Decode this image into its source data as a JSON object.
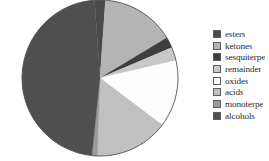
{
  "chart_data": {
    "type": "pie",
    "title": "",
    "subtitle": "",
    "xlabel": "",
    "ylabel": "",
    "grid": false,
    "legend_position": "right",
    "start_angle_deg": -94,
    "direction": "clockwise",
    "categories": [
      "esters",
      "ketones",
      "sesquiterpe",
      "remainder",
      "oxides",
      "acids",
      "monoterpe",
      "alcohols"
    ],
    "values": [
      2.2,
      15.3,
      2.2,
      2.8,
      13.9,
      15.3,
      1.1,
      47.2
    ],
    "angles_deg": [
      8,
      55,
      8,
      10,
      50,
      55,
      4,
      170
    ],
    "colors": [
      "#4a4a4a",
      "#b4b4b4",
      "#3e3e3e",
      "#c8c8c8",
      "#fdfdfd",
      "#c0c0c0",
      "#9a9a9a",
      "#4f4f4f"
    ],
    "slices": [
      {
        "label": "esters",
        "value": 2.2,
        "angle_deg": 8,
        "color": "#4a4a4a"
      },
      {
        "label": "ketones",
        "value": 15.3,
        "angle_deg": 55,
        "color": "#b4b4b4"
      },
      {
        "label": "sesquiterpe",
        "value": 2.2,
        "angle_deg": 8,
        "color": "#3e3e3e"
      },
      {
        "label": "remainder",
        "value": 2.8,
        "angle_deg": 10,
        "color": "#c8c8c8"
      },
      {
        "label": "oxides",
        "value": 13.9,
        "angle_deg": 50,
        "color": "#fdfdfd"
      },
      {
        "label": "acids",
        "value": 15.3,
        "angle_deg": 55,
        "color": "#c0c0c0"
      },
      {
        "label": "monoterpe",
        "value": 1.1,
        "angle_deg": 4,
        "color": "#9a9a9a"
      },
      {
        "label": "alcohols",
        "value": 47.2,
        "angle_deg": 170,
        "color": "#4f4f4f"
      }
    ]
  },
  "legend": {
    "items": [
      {
        "label": "esters",
        "color": "#4a4a4a"
      },
      {
        "label": "ketones",
        "color": "#b4b4b4"
      },
      {
        "label": "sesquiterpe",
        "color": "#3e3e3e"
      },
      {
        "label": "remainder",
        "color": "#c8c8c8"
      },
      {
        "label": "oxides",
        "color": "#fdfdfd"
      },
      {
        "label": "acids",
        "color": "#c0c0c0"
      },
      {
        "label": "monoterpe",
        "color": "#9a9a9a"
      },
      {
        "label": "alcohols",
        "color": "#4f4f4f"
      }
    ]
  },
  "style": {
    "pie_outline_color": "#555555",
    "background": "#ffffff",
    "center_x": 100,
    "center_y": 78,
    "radius": 78
  }
}
